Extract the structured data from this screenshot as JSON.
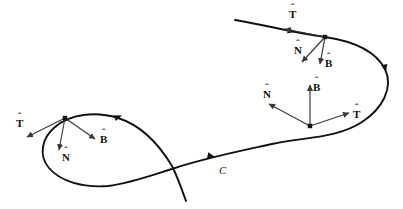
{
  "figure": {
    "background_color": "#ffffff",
    "curve_color": "#111111",
    "vector_color": "#3a3a3a",
    "point_color": "#111111",
    "width": 403,
    "height": 209
  },
  "curve": {
    "name": "C",
    "label": "C",
    "label_x": 219,
    "label_y": 164,
    "path": "M 235 20 C 265 25 295 33 325 37 C 352 41 375 50 385 69 C 394 88 382 109 362 122 C 338 138 305 137 272 144 C 240 151 205 158 175 168 C 150 176 128 184 108 186 C 82 188 60 181 49 168 C 38 155 42 138 55 127 C 70 114 95 111 118 118 C 143 126 160 146 172 166 C 178 178 182 190 186 201",
    "direction_markers": [
      {
        "name": "flow-arrow-left-upper",
        "x": 118,
        "y": 117,
        "angle": -20
      },
      {
        "name": "flow-arrow-mid",
        "x": 211,
        "y": 156,
        "angle": 13
      },
      {
        "name": "flow-arrow-right",
        "x": 385,
        "y": 68,
        "angle": 78
      },
      {
        "name": "flow-arrow-top",
        "x": 291,
        "y": 31,
        "angle": 9
      }
    ]
  },
  "frames": [
    {
      "id": "frame-upper-right",
      "point": {
        "x": 325,
        "y": 37
      },
      "vectors": [
        {
          "name": "tangent",
          "symbol": "T",
          "hat": "ˆ",
          "tip": {
            "x": 285,
            "y": 29
          },
          "label_x": 289,
          "label_y": 6
        },
        {
          "name": "normal",
          "symbol": "N",
          "hat": "ˆ",
          "tip": {
            "x": 302,
            "y": 62
          },
          "label_x": 294,
          "label_y": 42
        },
        {
          "name": "binormal",
          "symbol": "B",
          "hat": "ˆ",
          "tip": {
            "x": 320,
            "y": 64
          },
          "label_x": 325,
          "label_y": 55
        }
      ]
    },
    {
      "id": "frame-middle",
      "point": {
        "x": 310,
        "y": 126
      },
      "vectors": [
        {
          "name": "tangent",
          "symbol": "T",
          "hat": "ˆ",
          "tip": {
            "x": 349,
            "y": 113
          },
          "label_x": 353,
          "label_y": 106
        },
        {
          "name": "normal",
          "symbol": "N",
          "hat": "ˆ",
          "tip": {
            "x": 269,
            "y": 104
          },
          "label_x": 263,
          "label_y": 86
        },
        {
          "name": "binormal",
          "symbol": "B",
          "hat": "ˆ",
          "tip": {
            "x": 310,
            "y": 85
          },
          "label_x": 313,
          "label_y": 79
        }
      ]
    },
    {
      "id": "frame-left",
      "point": {
        "x": 65,
        "y": 118
      },
      "vectors": [
        {
          "name": "tangent",
          "symbol": "T",
          "hat": "ˆ",
          "tip": {
            "x": 27,
            "y": 137
          },
          "label_x": 16,
          "label_y": 115
        },
        {
          "name": "normal",
          "symbol": "N",
          "hat": "ˆ",
          "tip": {
            "x": 59,
            "y": 150
          },
          "label_x": 62,
          "label_y": 149
        },
        {
          "name": "binormal",
          "symbol": "B",
          "hat": "ˆ",
          "tip": {
            "x": 95,
            "y": 139
          },
          "label_x": 100,
          "label_y": 131
        }
      ]
    }
  ]
}
